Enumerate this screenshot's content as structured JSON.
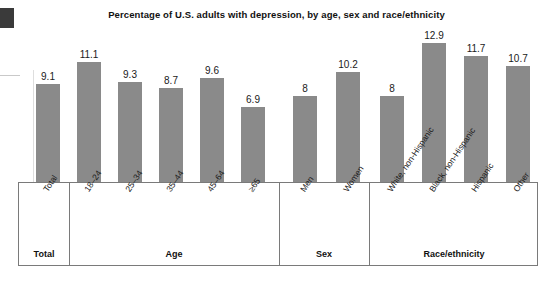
{
  "chart_data": {
    "type": "bar",
    "title": "Percentage of U.S. adults with depression, by age, sex and race/ethnicity",
    "xlabel": "",
    "ylabel": "",
    "ylim": [
      0,
      13.5
    ],
    "grid": false,
    "legend": "none",
    "categories": [
      "Total",
      "18–24",
      "25–34",
      "35–44",
      "45–64",
      "≥65",
      "Men",
      "Women",
      "White, non-Hispanic",
      "Black, non-Hispanic",
      "Hispanic",
      "Other"
    ],
    "values": [
      9.1,
      11.1,
      9.3,
      8.7,
      9.6,
      6.9,
      8,
      10.2,
      8,
      12.9,
      11.7,
      10.7
    ],
    "value_labels": [
      "9.1",
      "11.1",
      "9.3",
      "8.7",
      "9.6",
      "6.9",
      "8",
      "10.2",
      "8",
      "12.9",
      "11.7",
      "10.7"
    ],
    "bar_color": "#8a8a8a",
    "groups": [
      {
        "label": "Total",
        "categories": [
          "Total"
        ]
      },
      {
        "label": "Age",
        "categories": [
          "18–24",
          "25–34",
          "35–44",
          "45–64",
          "≥65"
        ]
      },
      {
        "label": "Sex",
        "categories": [
          "Men",
          "Women"
        ]
      },
      {
        "label": "Race/ethnicity",
        "categories": [
          "White, non-Hispanic",
          "Black, non-Hispanic",
          "Hispanic",
          "Other"
        ]
      }
    ]
  },
  "layout": {
    "bars": [
      {
        "x": 36,
        "label_index": 0
      },
      {
        "x": 77,
        "label_index": 1
      },
      {
        "x": 118,
        "label_index": 2
      },
      {
        "x": 159,
        "label_index": 3
      },
      {
        "x": 200,
        "label_index": 4
      },
      {
        "x": 241,
        "label_index": 5
      },
      {
        "x": 293,
        "label_index": 6
      },
      {
        "x": 336,
        "label_index": 7
      },
      {
        "x": 380,
        "label_index": 8
      },
      {
        "x": 422,
        "label_index": 9
      },
      {
        "x": 464,
        "label_index": 10
      },
      {
        "x": 506,
        "label_index": 11
      }
    ],
    "group_bounds": [
      {
        "left": 0,
        "width": 50
      },
      {
        "left": 50,
        "width": 210
      },
      {
        "left": 260,
        "width": 90
      },
      {
        "left": 350,
        "width": 170
      }
    ]
  }
}
